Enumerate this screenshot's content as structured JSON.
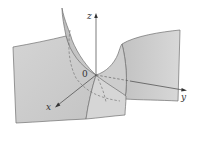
{
  "figure": {
    "labels": {
      "z_axis": "z",
      "y_axis": "y",
      "x_axis": "x",
      "origin": "0"
    },
    "colors": {
      "surface_light": "#d9d9d9",
      "surface_mid": "#c8c8c8",
      "surface_dark": "#b4b4b4",
      "edge": "#6e6e6e",
      "axis": "#444444",
      "background": "#ffffff"
    }
  }
}
